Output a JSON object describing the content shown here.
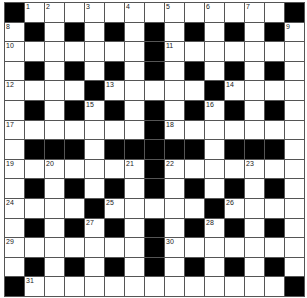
{
  "puzzle": {
    "type": "crossword",
    "size": 15,
    "colors": {
      "black": "#000000",
      "white": "#ffffff",
      "gridline": "#555555",
      "number": "#222222"
    },
    "rows": [
      "#.............#",
      ".#.#.#.#.#.#.#.",
      ".......#.......",
      ".#.#.#.#.#.#.#.",
      "....#.....#....",
      ".#.#.#.#.#.#.#.",
      ".......#.......",
      ".###.#####.###.",
      ".......#.......",
      ".#.#.#.#.#.#.#.",
      "....#.....#....",
      ".#.#.#.#.#.#.#.",
      ".......#.......",
      ".#.#.#.#.#.#.#.",
      "#.............#"
    ],
    "numbers": [
      {
        "r": 0,
        "c": 1,
        "n": "1"
      },
      {
        "r": 0,
        "c": 2,
        "n": "2"
      },
      {
        "r": 0,
        "c": 4,
        "n": "3"
      },
      {
        "r": 0,
        "c": 6,
        "n": "4"
      },
      {
        "r": 0,
        "c": 8,
        "n": "5"
      },
      {
        "r": 0,
        "c": 10,
        "n": "6"
      },
      {
        "r": 0,
        "c": 12,
        "n": "7"
      },
      {
        "r": 1,
        "c": 0,
        "n": "8"
      },
      {
        "r": 1,
        "c": 14,
        "n": "9"
      },
      {
        "r": 2,
        "c": 0,
        "n": "10"
      },
      {
        "r": 2,
        "c": 8,
        "n": "11"
      },
      {
        "r": 4,
        "c": 0,
        "n": "12"
      },
      {
        "r": 4,
        "c": 5,
        "n": "13"
      },
      {
        "r": 4,
        "c": 11,
        "n": "14"
      },
      {
        "r": 5,
        "c": 4,
        "n": "15"
      },
      {
        "r": 5,
        "c": 10,
        "n": "16"
      },
      {
        "r": 6,
        "c": 0,
        "n": "17"
      },
      {
        "r": 6,
        "c": 8,
        "n": "18"
      },
      {
        "r": 8,
        "c": 0,
        "n": "19"
      },
      {
        "r": 8,
        "c": 2,
        "n": "20"
      },
      {
        "r": 8,
        "c": 6,
        "n": "21"
      },
      {
        "r": 8,
        "c": 8,
        "n": "22"
      },
      {
        "r": 8,
        "c": 12,
        "n": "23"
      },
      {
        "r": 10,
        "c": 0,
        "n": "24"
      },
      {
        "r": 10,
        "c": 5,
        "n": "25"
      },
      {
        "r": 10,
        "c": 11,
        "n": "26"
      },
      {
        "r": 11,
        "c": 4,
        "n": "27"
      },
      {
        "r": 11,
        "c": 10,
        "n": "28"
      },
      {
        "r": 12,
        "c": 0,
        "n": "29"
      },
      {
        "r": 12,
        "c": 8,
        "n": "30"
      },
      {
        "r": 14,
        "c": 1,
        "n": "31"
      }
    ]
  }
}
